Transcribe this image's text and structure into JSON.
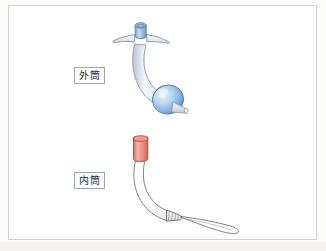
{
  "figure": {
    "kind": "medical-illustration",
    "background_color": "#fbfbf9",
    "card_color": "#ffffff",
    "card_border_color": "#d2d2d2"
  },
  "labels": {
    "outer_cannula": "外筒",
    "inner_cannula": "内筒"
  },
  "parts": {
    "outer_cannula": {
      "name": "外筒",
      "connector_hub": {
        "icon": "cylindrical-hub",
        "fill_top": "#a9c8e4",
        "fill_body": "#8fb4d8",
        "stroke": "#5b7fa6"
      },
      "neck_flange": {
        "icon": "wing-flange",
        "fill": "#eef2f6",
        "stroke": "#7d8d9c"
      },
      "shaft": {
        "icon": "curved-tube",
        "fill": "#e9eef3",
        "stroke": "#8a98a6"
      },
      "cuff_balloon": {
        "icon": "inflated-cuff",
        "fill_light": "#cfe2f5",
        "fill_dark": "#79a8d8",
        "stroke": "#4f7fb4"
      },
      "distal_stub": {
        "icon": "tube-stub",
        "fill": "#e6ebf0",
        "stroke": "#8a98a6"
      }
    },
    "inner_cannula": {
      "name": "内筒",
      "connector": {
        "icon": "red-connector-hub",
        "fill_light": "#f4a39a",
        "fill_dark": "#dd6e63",
        "stroke": "#b4433a"
      },
      "shaft": {
        "icon": "curved-thin-tube",
        "fill": "#ffffff",
        "stroke": "#6f6f6f"
      },
      "tip": {
        "icon": "tube-tip",
        "fill": "#f2f2f2",
        "stroke": "#5e5e5e"
      },
      "obturator_loop": {
        "icon": "wire-loop-handle",
        "stroke": "#7a7a7a"
      }
    }
  },
  "palette": {
    "blue_accent": "#7fa8cc",
    "red_accent": "#e8847a",
    "outline_gray": "#7d8d9c",
    "label_border": "#9aa7b4"
  }
}
